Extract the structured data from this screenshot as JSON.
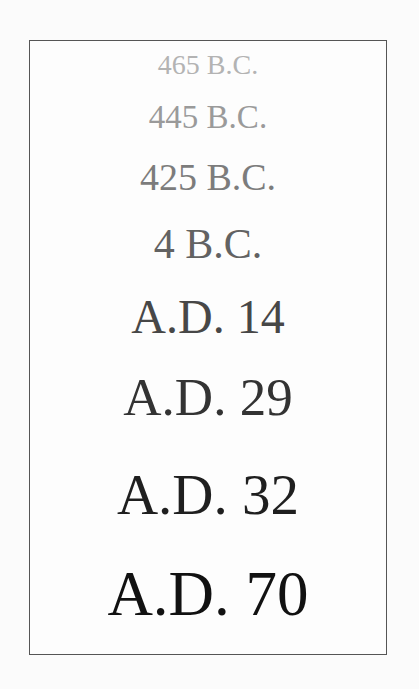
{
  "timeline": {
    "dates": [
      {
        "label": "465 B.C.",
        "color": "#b3b3b3",
        "size": 28,
        "top": 10
      },
      {
        "label": "445 B.C.",
        "color": "#9a9a9a",
        "size": 33,
        "top": 60
      },
      {
        "label": "425 B.C.",
        "color": "#7c7c7c",
        "size": 38,
        "top": 117
      },
      {
        "label": "4 B.C.",
        "color": "#626262",
        "size": 42,
        "top": 182
      },
      {
        "label": "A.D. 14",
        "color": "#474747",
        "size": 48,
        "top": 252
      },
      {
        "label": "A.D. 29",
        "color": "#333333",
        "size": 53,
        "top": 330
      },
      {
        "label": "A.D. 32",
        "color": "#1f1f1f",
        "size": 57,
        "top": 425
      },
      {
        "label": "A.D. 70",
        "color": "#111111",
        "size": 63,
        "top": 522
      }
    ]
  }
}
